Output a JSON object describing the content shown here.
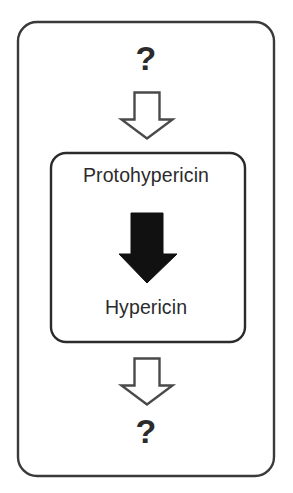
{
  "diagram": {
    "outer_container": {
      "name": "pathway-container",
      "stroke_color": "#3a3a3a"
    },
    "top_unknown": {
      "label": "?",
      "icon": "question-mark"
    },
    "top_arrow": {
      "icon": "down-arrow-outline-icon",
      "style": "hollow",
      "fill": "#ffffff",
      "stroke": "#4a4a4a"
    },
    "inner_container": {
      "name": "known-steps-box",
      "stroke_color": "#2b2b2b"
    },
    "precursor": {
      "label": "Protohypericin"
    },
    "conversion_arrow": {
      "icon": "down-arrow-solid-icon",
      "style": "solid",
      "fill": "#111111"
    },
    "product": {
      "label": "Hypericin"
    },
    "bottom_arrow": {
      "icon": "down-arrow-outline-icon",
      "style": "hollow",
      "fill": "#ffffff",
      "stroke": "#4a4a4a"
    },
    "bottom_unknown": {
      "label": "?",
      "icon": "question-mark"
    }
  }
}
